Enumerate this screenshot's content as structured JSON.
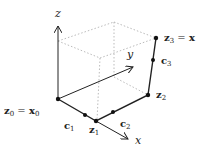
{
  "axes": {
    "x": "x",
    "y": "y",
    "z": "z"
  },
  "points": {
    "z0": {
      "label": "z",
      "sub": "0",
      "eq": " = ",
      "rhs": "x",
      "rhs_sub": "0"
    },
    "z1": {
      "label": "z",
      "sub": "1"
    },
    "z2": {
      "label": "z",
      "sub": "2"
    },
    "z3": {
      "label": "z",
      "sub": "3",
      "eq": " = ",
      "rhs": "x"
    },
    "c1": {
      "label": "c",
      "sub": "1"
    },
    "c2": {
      "label": "c",
      "sub": "2"
    },
    "c3": {
      "label": "c",
      "sub": "3"
    }
  },
  "colors": {
    "line": "#222222",
    "dotted": "#aaaaaa"
  }
}
